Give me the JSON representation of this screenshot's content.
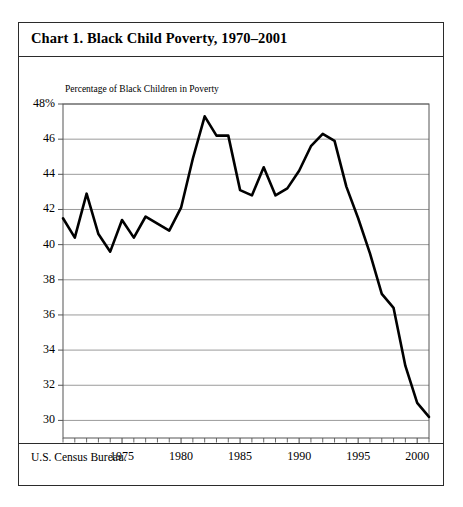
{
  "figure": {
    "title": "Chart 1. Black Child Poverty, 1970–2001",
    "source": "U.S. Census Bureau.",
    "subtitle": "Percentage of Black Children in Poverty",
    "frame_color": "#2b2b2b",
    "line_color": "#000000",
    "grid_color": "#8f8f8f"
  },
  "chart_data": {
    "type": "line",
    "title": "Chart 1. Black Child Poverty, 1970–2001",
    "subtitle": "Percentage of Black Children in Poverty",
    "xlabel": "",
    "ylabel": "Percentage of Black Children in Poverty",
    "source": "U.S. Census Bureau.",
    "grid": true,
    "legend": "none",
    "xlim": [
      1970,
      2001
    ],
    "ylim": [
      29,
      48
    ],
    "ytick_labels": [
      "48%",
      "46",
      "44",
      "42",
      "40",
      "38",
      "36",
      "34",
      "32",
      "30"
    ],
    "yticks": [
      48,
      46,
      44,
      42,
      40,
      38,
      36,
      34,
      32,
      30
    ],
    "xtick_labels": [
      "1975",
      "1980",
      "1985",
      "1990",
      "1995",
      "2000"
    ],
    "xticks": [
      1975,
      1980,
      1985,
      1990,
      1995,
      2000
    ],
    "x_minor_tick_interval": 1,
    "x": [
      1970,
      1971,
      1972,
      1973,
      1974,
      1975,
      1976,
      1977,
      1978,
      1979,
      1980,
      1981,
      1982,
      1983,
      1984,
      1985,
      1986,
      1987,
      1988,
      1989,
      1990,
      1991,
      1992,
      1993,
      1994,
      1995,
      1996,
      1997,
      1998,
      1999,
      2000,
      2001
    ],
    "values": [
      41.5,
      40.4,
      42.9,
      40.6,
      39.6,
      41.4,
      40.4,
      41.6,
      41.2,
      40.8,
      42.1,
      44.9,
      47.3,
      46.2,
      46.2,
      43.1,
      42.8,
      44.4,
      42.8,
      43.2,
      44.2,
      45.6,
      46.3,
      45.9,
      43.3,
      41.5,
      39.5,
      37.2,
      36.4,
      33.1,
      31.0,
      30.2
    ],
    "annotations": [
      {
        "text": "peak",
        "x": 1982,
        "y": 47.3
      },
      {
        "text": "secondary peak",
        "x": 1992,
        "y": 46.3
      },
      {
        "text": "series end",
        "x": 2001,
        "y": 30.2
      }
    ]
  }
}
